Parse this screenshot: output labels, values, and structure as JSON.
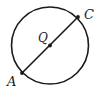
{
  "figure": {
    "name": "circle-with-diameter",
    "background_color": "#ffffff",
    "stroke_color": "#1a1a1a",
    "labels": {
      "center": "Q",
      "endpoint_lower_left": "A",
      "endpoint_upper_right": "C"
    },
    "geometry": {
      "circle": {
        "cx": 50,
        "cy": 45.5,
        "r": 38.5,
        "stroke_width": 1.6
      },
      "diameter": {
        "x1": 22,
        "y1": 73,
        "x2": 78,
        "y2": 17,
        "stroke_width": 1.6
      },
      "points": [
        {
          "id": "A",
          "x": 22,
          "y": 73,
          "dot_r": 1.9
        },
        {
          "id": "Q",
          "x": 50,
          "y": 45.5,
          "dot_r": 1.9
        },
        {
          "id": "C",
          "x": 78,
          "y": 17,
          "dot_r": 1.9
        }
      ],
      "label_positions": [
        {
          "id": "A",
          "x": 7,
          "y": 86
        },
        {
          "id": "Q",
          "x": 38,
          "y": 42
        },
        {
          "id": "C",
          "x": 84,
          "y": 19
        }
      ]
    }
  }
}
